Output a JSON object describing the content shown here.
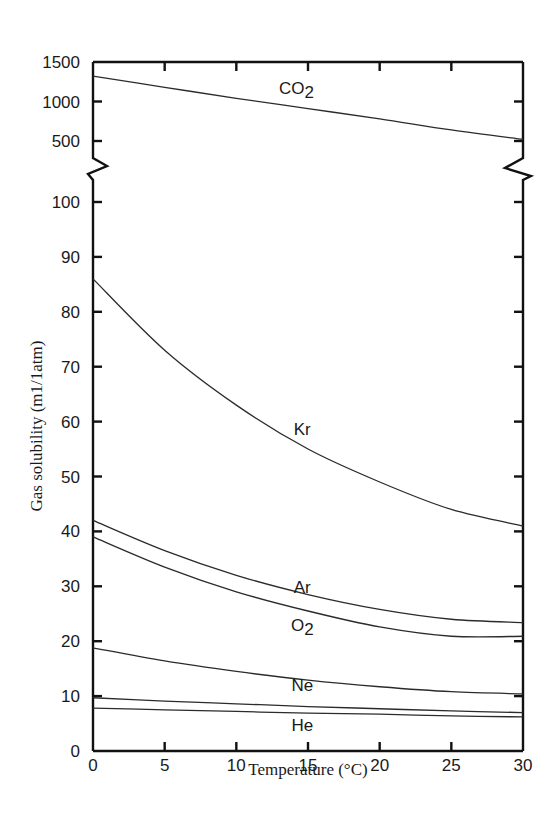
{
  "chart_data": {
    "type": "line",
    "title": "",
    "xlabel": "Temperature (°C)",
    "ylabel": "Gas solubility (m1/1atm)",
    "xlim": [
      0,
      30
    ],
    "x_ticks": [
      0,
      5,
      10,
      15,
      20,
      25,
      30
    ],
    "y_axis_broken": true,
    "ylim_lower": [
      0,
      100
    ],
    "y_ticks_lower": [
      0,
      10,
      20,
      30,
      40,
      50,
      60,
      70,
      80,
      90,
      100
    ],
    "ylim_upper": [
      500,
      1500
    ],
    "y_ticks_upper": [
      500,
      1000,
      1500
    ],
    "grid": false,
    "legend": "inline labels",
    "x": [
      0,
      5,
      10,
      15,
      20,
      25,
      30
    ],
    "series": [
      {
        "name": "CO2",
        "label": "CO2",
        "segment": "upper",
        "values": [
          1320,
          1180,
          1040,
          910,
          780,
          640,
          520
        ],
        "label_pos": [
          14.2,
          1100
        ]
      },
      {
        "name": "Kr",
        "label": "Kr",
        "segment": "lower",
        "values": [
          86,
          73,
          63,
          55,
          49,
          44,
          41
        ],
        "label_pos": [
          14.6,
          57.5
        ]
      },
      {
        "name": "Ar",
        "label": "Ar",
        "segment": "lower",
        "values": [
          42,
          36.5,
          32,
          28.5,
          25.8,
          24,
          23.4
        ],
        "label_pos": [
          14.6,
          28.8
        ]
      },
      {
        "name": "O2",
        "label": "O2",
        "segment": "lower",
        "values": [
          39,
          33.5,
          29,
          25.5,
          22.6,
          20.9,
          20.9
        ],
        "label_pos": [
          14.6,
          21.8
        ]
      },
      {
        "name": "unlabeled",
        "label": "",
        "segment": "lower",
        "values": [
          18.8,
          16.4,
          14.5,
          12.9,
          11.7,
          10.8,
          10.4
        ],
        "label_pos": null
      },
      {
        "name": "Ne",
        "label": "Ne",
        "segment": "lower",
        "values": [
          9.7,
          9.1,
          8.6,
          8.1,
          7.7,
          7.3,
          7.0
        ],
        "label_pos": [
          14.6,
          11.0
        ]
      },
      {
        "name": "He",
        "label": "He",
        "segment": "lower",
        "values": [
          7.8,
          7.5,
          7.2,
          6.9,
          6.7,
          6.4,
          6.2
        ],
        "label_pos": [
          14.6,
          3.6
        ]
      }
    ]
  }
}
